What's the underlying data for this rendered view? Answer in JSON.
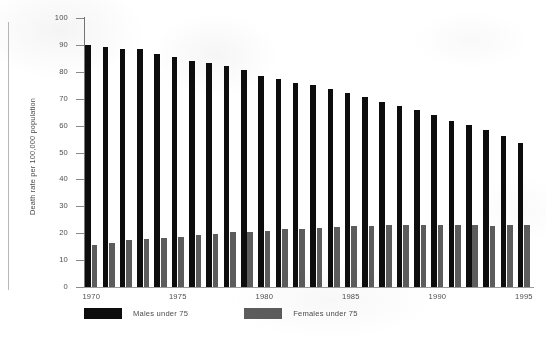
{
  "chart_data": {
    "type": "bar",
    "title": "",
    "subtitle": "",
    "xlabel": "",
    "ylabel": "Death rate per 100,000 population",
    "ylim": [
      0,
      100
    ],
    "yticks": [
      0,
      10,
      20,
      30,
      40,
      50,
      60,
      70,
      80,
      90,
      100
    ],
    "xticks_shown": [
      "1970",
      "1975",
      "1980",
      "1985",
      "1990",
      "1995"
    ],
    "grid": false,
    "legend_position": "bottom-left",
    "categories": [
      "1970",
      "1971",
      "1972",
      "1973",
      "1974",
      "1975",
      "1976",
      "1977",
      "1978",
      "1979",
      "1980",
      "1981",
      "1982",
      "1983",
      "1984",
      "1985",
      "1986",
      "1987",
      "1988",
      "1989",
      "1990",
      "1991",
      "1992",
      "1993",
      "1994",
      "1995"
    ],
    "series": [
      {
        "name": "Males under 75",
        "color": "#0d0d0d",
        "values": [
          90.0,
          89.3,
          88.6,
          88.3,
          86.5,
          85.4,
          83.9,
          83.4,
          82.0,
          80.5,
          78.3,
          77.3,
          76.0,
          75.2,
          73.6,
          72.0,
          70.8,
          68.9,
          67.3,
          65.7,
          63.9,
          61.7,
          60.2,
          58.5,
          56.0,
          53.7
        ]
      },
      {
        "name": "Females under 75",
        "color": "#5c5c5c",
        "values": [
          15.5,
          16.2,
          17.3,
          17.8,
          18.3,
          18.7,
          19.2,
          19.7,
          20.3,
          20.6,
          21.0,
          21.4,
          21.7,
          22.1,
          22.4,
          22.6,
          22.8,
          23.0,
          23.1,
          23.2,
          22.9,
          23.0,
          22.9,
          22.8,
          22.9,
          23.0
        ]
      }
    ]
  },
  "axis": {
    "y_title": "Death rate per 100,000 population",
    "y_tick_labels": [
      "100",
      "90",
      "80",
      "70",
      "60",
      "50",
      "40",
      "30",
      "20",
      "10",
      "0"
    ],
    "x_tick_labels": [
      "1970",
      "1975",
      "1980",
      "1985",
      "1990",
      "1995"
    ]
  },
  "legend": {
    "males_label": "Males under 75",
    "females_label": "Females under 75"
  }
}
